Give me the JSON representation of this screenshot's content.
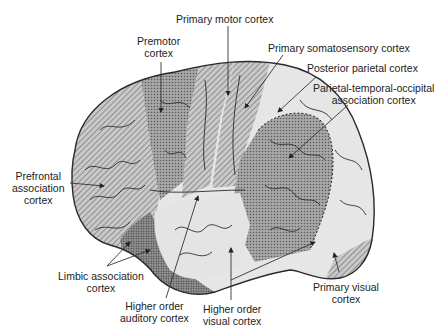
{
  "figure": {
    "type": "anatomical-diagram"
  },
  "colors": {
    "background": "#ffffff",
    "outline": "#2a2a2a",
    "motor_hatch": "#8c8c8c",
    "association_dots": "#7a7a7a",
    "higher_order_fill": "#e6e6e6",
    "limbic_dots": "#6e6e6e",
    "label_text": "#222222",
    "leader_line": "#333333"
  },
  "labels": {
    "primary_motor": "Primary motor cortex",
    "premotor_line1": "Premotor",
    "premotor_line2": "cortex",
    "primary_somatosensory": "Primary somatosensory cortex",
    "posterior_parietal": "Posterior parietal cortex",
    "pto_line1": "Parietal-temporal-occipital",
    "pto_line2": "association cortex",
    "prefrontal_line1": "Prefrontal",
    "prefrontal_line2": "association",
    "prefrontal_line3": "cortex",
    "limbic_line1": "Limbic association",
    "limbic_line2": "cortex",
    "auditory_line1": "Higher order",
    "auditory_line2": "auditory cortex",
    "visual_line1": "Higher order",
    "visual_line2": "visual cortex",
    "primary_visual_line1": "Primary visual",
    "primary_visual_line2": "cortex"
  },
  "regions": [
    {
      "id": "prefrontal",
      "name": "Prefrontal association cortex",
      "pattern": "hatch"
    },
    {
      "id": "premotor",
      "name": "Premotor cortex",
      "pattern": "dots"
    },
    {
      "id": "primary-motor",
      "name": "Primary motor cortex",
      "pattern": "hatch"
    },
    {
      "id": "primary-somatosensory",
      "name": "Primary somatosensory cortex",
      "pattern": "hatch"
    },
    {
      "id": "posterior-parietal",
      "name": "Posterior parietal cortex",
      "pattern": "light"
    },
    {
      "id": "pto",
      "name": "Parietal-temporal-occipital association cortex",
      "pattern": "dots"
    },
    {
      "id": "limbic",
      "name": "Limbic association cortex",
      "pattern": "dense-dots"
    },
    {
      "id": "auditory",
      "name": "Higher order auditory cortex",
      "pattern": "light"
    },
    {
      "id": "higher-visual",
      "name": "Higher order visual cortex",
      "pattern": "light"
    },
    {
      "id": "primary-visual",
      "name": "Primary visual cortex",
      "pattern": "hatch"
    }
  ]
}
